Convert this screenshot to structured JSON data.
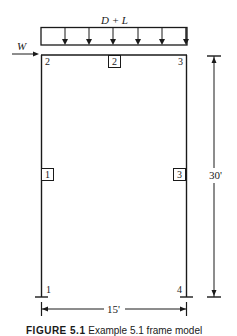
{
  "diagram": {
    "type": "structural-frame",
    "load_label": "D + L",
    "lateral_load_label": "W",
    "nodes": [
      {
        "id": "1",
        "label": "1",
        "position": "bottom-left"
      },
      {
        "id": "2",
        "label": "2",
        "position": "top-left"
      },
      {
        "id": "3",
        "label": "3",
        "position": "top-right"
      },
      {
        "id": "4",
        "label": "4",
        "position": "bottom-right"
      }
    ],
    "members": [
      {
        "id": "1",
        "label": "1",
        "from": "1",
        "to": "2",
        "type": "column"
      },
      {
        "id": "2",
        "label": "2",
        "from": "2",
        "to": "3",
        "type": "beam"
      },
      {
        "id": "3",
        "label": "3",
        "from": "3",
        "to": "4",
        "type": "column"
      }
    ],
    "dimensions": {
      "height_label": "30'",
      "width_label": "15'"
    },
    "distributed_load_arrow_count": 6,
    "colors": {
      "line": "#1a1a1a",
      "background": "#ffffff"
    }
  },
  "caption": {
    "figure_label": "FIGURE 5.1",
    "text": "Example 5.1 frame model"
  }
}
